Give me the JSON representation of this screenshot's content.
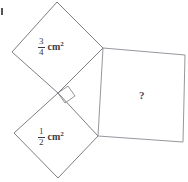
{
  "figure": {
    "canvas": {
      "width": 188,
      "height": 182
    },
    "stroke_color": "#6e6e76",
    "text_color": "#3b3b42",
    "background": "#ffffff",
    "squares": [
      {
        "id": "top-square",
        "name": "upper-left-square",
        "points": "57,2 103,48 58,93 12,52",
        "area_numerator": "3",
        "area_denominator": "4",
        "unit": "cm",
        "unit_exponent": "2"
      },
      {
        "id": "bottom-square",
        "name": "lower-left-square",
        "points": "58,93 98,136 58,178 14,133",
        "area_numerator": "1",
        "area_denominator": "2",
        "unit": "cm",
        "unit_exponent": "2"
      },
      {
        "id": "right-square",
        "name": "right-square",
        "points": "103,48 185,55 183,142 98,136",
        "label": "?"
      }
    ],
    "right_angle_marker": {
      "name": "right-angle-marker",
      "points": "58,93 68,86 75,96 65,103"
    },
    "corner_tick": {
      "name": "corner-artifact-tick",
      "x": 1,
      "y": 8,
      "width": 2,
      "height": 7
    }
  }
}
